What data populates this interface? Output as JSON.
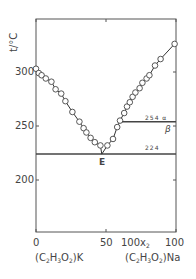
{
  "chart_data": {
    "type": "line",
    "title": "",
    "xlabel": "100x₂",
    "ylabel": "t/°C",
    "xlim": [
      0,
      100
    ],
    "ylim": [
      152,
      349
    ],
    "x_ticks": [
      0,
      50,
      100
    ],
    "y_ticks": [
      200,
      250,
      300
    ],
    "x_endpoint_labels": {
      "left": "(C2H3O2)K",
      "right": "(C2H3O2)Na"
    },
    "grid": false,
    "legend": null,
    "series": [
      {
        "name": "liquidus (K-rich branch)",
        "marker": "open-circle",
        "x": [
          0,
          2,
          4,
          7,
          11,
          14,
          18,
          21,
          26,
          31,
          34,
          36,
          39,
          42,
          46
        ],
        "y": [
          303,
          299,
          297,
          294,
          291,
          284,
          280,
          273,
          263,
          254,
          248,
          244,
          239,
          235,
          232
        ]
      },
      {
        "name": "liquidus (Na-rich branch)",
        "marker": "open-circle",
        "x": [
          51,
          55,
          58,
          60,
          63,
          65,
          67,
          69,
          71,
          74,
          76,
          79,
          81,
          85,
          89,
          99
        ],
        "y": [
          232,
          238,
          249,
          255,
          262,
          268,
          272,
          277,
          281,
          285,
          290,
          294,
          297,
          306,
          312,
          326
        ]
      }
    ],
    "horizontal_lines": [
      {
        "y": 224,
        "x_from": 0,
        "x_to": 100,
        "label": "224"
      },
      {
        "y": 254,
        "x_from": 59,
        "x_to": 100,
        "label": "254 α",
        "below_label": "β"
      }
    ],
    "annotations": [
      {
        "text": "E",
        "x": 47,
        "y": 224,
        "meaning": "eutectic point"
      }
    ]
  },
  "labels": {
    "y_axis": "t/°C",
    "y_tick_300": "300",
    "y_tick_250": "250",
    "y_tick_200": "200",
    "x_tick_0": "0",
    "x_tick_50": "50",
    "x_tick_100": "100",
    "x_axis": "100x",
    "x_axis_sub": "2",
    "eutectic": "E",
    "line_224": "224",
    "line_254": "254 α",
    "beta": "β",
    "left_compound": [
      "(C",
      "2",
      "H",
      "3",
      "O",
      "2",
      ")K"
    ],
    "right_compound": [
      "(C",
      "2",
      "H",
      "3",
      "O",
      "2",
      ")Na"
    ]
  }
}
